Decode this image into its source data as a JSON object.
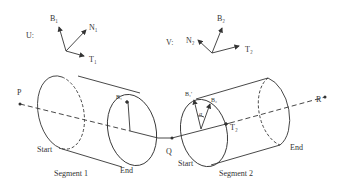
{
  "frames": {
    "u": {
      "label": "U:",
      "b": "B₁",
      "n": "N₁",
      "t": "T₁"
    },
    "v": {
      "label": "V:",
      "b": "B₂",
      "n": "N₂",
      "t": "T₂"
    }
  },
  "points": {
    "p": "P",
    "q": "Q",
    "r": "R"
  },
  "segment1": {
    "name": "Segment 1",
    "start": "Start",
    "end": "End",
    "b_label": "B₁"
  },
  "segment2": {
    "name": "Segment 2",
    "start": "Start",
    "end": "End",
    "b_prime": "B₁'",
    "b": "B₂",
    "alpha": "α",
    "t": "T₂"
  },
  "colors": {
    "stroke": "#333333",
    "background": "#ffffff"
  }
}
